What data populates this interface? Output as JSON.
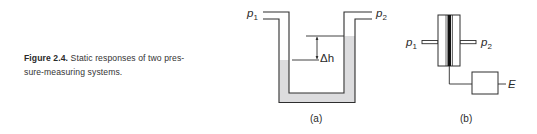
{
  "caption": {
    "figure_number": "Figure 2.4.",
    "line1_text": " Static responses of two pres-",
    "line2_text": "sure-measuring systems."
  },
  "figure_a": {
    "label": "(a)",
    "description": "U-tube manometer",
    "inlet_left": {
      "symbol": "p",
      "subscript": "1"
    },
    "inlet_right": {
      "symbol": "p",
      "subscript": "2"
    },
    "height_difference": {
      "symbol": "Δh"
    },
    "colors": {
      "stroke": "#2e2e2e",
      "fluid": "#dcdcde"
    }
  },
  "figure_b": {
    "label": "(b)",
    "description": "Diaphragm pressure transducer with output",
    "inlet_left": {
      "symbol": "p",
      "subscript": "1"
    },
    "inlet_right": {
      "symbol": "p",
      "subscript": "2"
    },
    "output": {
      "symbol": "E"
    },
    "colors": {
      "stroke": "#2e2e2e",
      "diaphragm": "#111111"
    }
  }
}
